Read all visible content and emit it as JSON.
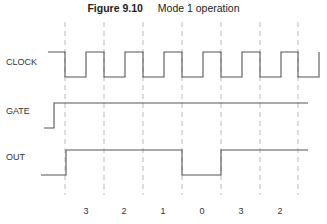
{
  "figure": {
    "number": "Figure 9.10",
    "caption": "Mode 1 operation"
  },
  "signals": [
    {
      "name": "CLOCK"
    },
    {
      "name": "GATE"
    },
    {
      "name": "OUT"
    }
  ],
  "counts": [
    "3",
    "2",
    "1",
    "0",
    "3",
    "2"
  ],
  "colors": {
    "line": "#555555",
    "dashed": "#aaaaaa",
    "text": "#333333"
  }
}
